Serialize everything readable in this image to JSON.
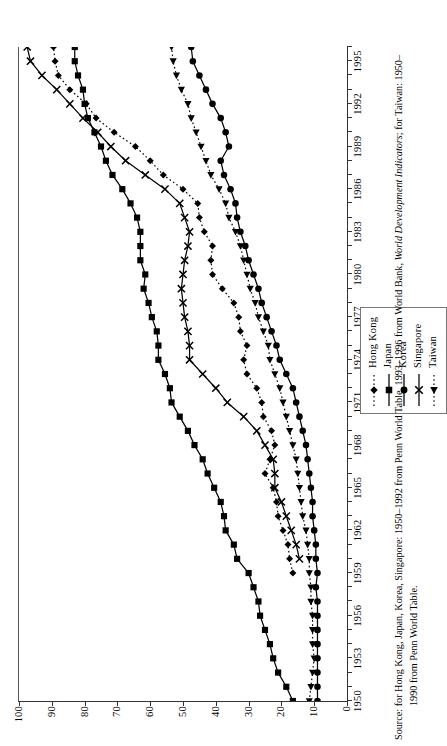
{
  "chart_data": {
    "type": "line",
    "title": "",
    "xlabel": "",
    "ylabel": "",
    "xlim": [
      1950,
      1996
    ],
    "ylim": [
      0,
      100
    ],
    "ytick_step": 10,
    "grid": false,
    "legend_position": "top-right-outside",
    "yticks": [
      "0",
      "10",
      "20",
      "30",
      "40",
      "50",
      "60",
      "70",
      "80",
      "90",
      "100"
    ],
    "xticks": [
      "1950",
      "1953",
      "1956",
      "1959",
      "1962",
      "1965",
      "1968",
      "1971",
      "1974",
      "1977",
      "1980",
      "1983",
      "1986",
      "1989",
      "1992",
      "1995"
    ],
    "x": [
      1950,
      1951,
      1952,
      1953,
      1954,
      1955,
      1956,
      1957,
      1958,
      1959,
      1960,
      1961,
      1962,
      1963,
      1964,
      1965,
      1966,
      1967,
      1968,
      1969,
      1970,
      1971,
      1972,
      1973,
      1974,
      1975,
      1976,
      1977,
      1978,
      1979,
      1980,
      1981,
      1982,
      1983,
      1984,
      1985,
      1986,
      1987,
      1988,
      1989,
      1990,
      1991,
      1992,
      1993,
      1994,
      1995,
      1996
    ],
    "series": [
      {
        "name": "Hong Kong",
        "marker": "diamond",
        "line": "dotted",
        "color": "#000000",
        "values": [
          null,
          null,
          null,
          null,
          null,
          null,
          null,
          null,
          null,
          16.5,
          17.5,
          18.0,
          19.5,
          21.0,
          21.5,
          22.5,
          25.0,
          23.5,
          22.0,
          23.0,
          25.5,
          26.0,
          27.5,
          30.5,
          31.5,
          30.5,
          32.5,
          33.0,
          34.5,
          38.0,
          41.0,
          41.5,
          41.0,
          43.5,
          45.0,
          45.5,
          50.0,
          56.0,
          60.0,
          64.5,
          71.0,
          76.5,
          79.5,
          84.5,
          88.0,
          89.0,
          89.5
        ]
      },
      {
        "name": "Japan",
        "marker": "square",
        "line": "solid",
        "color": "#000000",
        "values": [
          16.5,
          18.5,
          21.0,
          22.5,
          23.5,
          25.0,
          26.5,
          27.0,
          28.5,
          30.0,
          33.5,
          34.5,
          37.0,
          37.5,
          38.5,
          40.5,
          42.5,
          44.0,
          46.5,
          48.5,
          51.0,
          53.5,
          54.0,
          55.5,
          57.5,
          57.5,
          58.0,
          59.5,
          60.5,
          62.0,
          61.5,
          63.0,
          63.0,
          63.0,
          64.0,
          66.0,
          68.5,
          71.5,
          73.5,
          75.0,
          77.0,
          79.0,
          80.0,
          80.5,
          82.0,
          83.0,
          83.0
        ]
      },
      {
        "name": "Korea",
        "marker": "circle",
        "line": "solid",
        "color": "#000000",
        "values": [
          9.0,
          9.0,
          9.0,
          9.0,
          9.0,
          9.0,
          9.0,
          9.0,
          9.5,
          9.0,
          9.5,
          9.5,
          10.0,
          10.5,
          10.5,
          11.0,
          11.5,
          12.0,
          12.5,
          13.5,
          14.5,
          15.5,
          16.5,
          18.5,
          20.5,
          21.5,
          23.0,
          24.5,
          26.0,
          27.0,
          28.5,
          30.0,
          31.0,
          32.5,
          33.5,
          34.0,
          35.5,
          37.5,
          38.5,
          36.0,
          37.0,
          38.5,
          41.0,
          43.0,
          45.0,
          47.0,
          47.5
        ]
      },
      {
        "name": "Singapore",
        "marker": "cross",
        "line": "solid",
        "color": "#000000",
        "values": [
          null,
          null,
          null,
          null,
          null,
          null,
          null,
          null,
          null,
          null,
          14.5,
          15.5,
          17.0,
          18.5,
          20.0,
          22.0,
          22.0,
          22.5,
          25.0,
          27.5,
          31.5,
          36.5,
          40.0,
          44.0,
          48.0,
          48.0,
          48.5,
          49.5,
          50.0,
          50.5,
          50.0,
          49.5,
          48.5,
          48.0,
          49.5,
          51.0,
          55.5,
          61.5,
          67.5,
          72.0,
          76.0,
          80.5,
          84.5,
          88.5,
          93.0,
          96.5,
          97.5
        ]
      },
      {
        "name": "Taiwan",
        "marker": "triangle",
        "line": "dotted",
        "color": "#000000",
        "values": [
          11.5,
          11.0,
          10.5,
          10.0,
          10.5,
          10.5,
          10.5,
          11.0,
          11.0,
          11.5,
          11.5,
          12.0,
          12.5,
          13.5,
          14.0,
          14.5,
          15.0,
          15.5,
          16.5,
          17.5,
          18.5,
          19.5,
          20.5,
          22.0,
          23.5,
          24.0,
          25.5,
          27.0,
          28.0,
          29.5,
          30.5,
          31.5,
          32.5,
          34.0,
          36.0,
          37.0,
          39.0,
          41.5,
          43.0,
          44.5,
          46.0,
          47.5,
          48.5,
          50.5,
          52.0,
          53.0,
          53.5
        ]
      }
    ]
  },
  "legend": {
    "entries": [
      {
        "label": "Hong Kong"
      },
      {
        "label": "Japan"
      },
      {
        "label": "Korea"
      },
      {
        "label": "Singapore"
      },
      {
        "label": "Taiwan"
      }
    ]
  },
  "source": {
    "prefix": "Source: for Hong Kong, Japan, Korea, Singapore: 1950–1992 from Penn World Table, 1993–1996 from World Bank, ",
    "italic": "World Development Indicators",
    "middle": "; for Taiwan: 1950–",
    "second_line": "1990 from Penn World Table."
  }
}
